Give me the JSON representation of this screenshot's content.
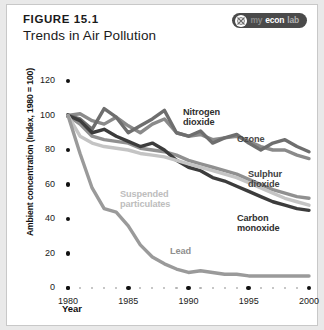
{
  "header": {
    "figure_number": "FIGURE 15.1",
    "title": "Trends in Air Pollution",
    "logo": {
      "icon": "myeconlab-circle-icon",
      "part1": "my",
      "part2": "econ",
      "part3": "lab"
    }
  },
  "colors": {
    "nitrogen_dioxide": "#8a8a8a",
    "ozone": "#6e6e6e",
    "sulphur_dioxide": "#909090",
    "carbon_monoxide": "#3c3c3c",
    "suspended_particulates": "#c4c4c4",
    "lead": "#9a9a9a",
    "axis": "#111111",
    "card_background": "#ffffff",
    "page_background": "#e9e9e9"
  },
  "chart_data": {
    "type": "line",
    "title": "Trends in Air Pollution",
    "xlabel": "Year",
    "ylabel": "Ambient concentration (Index, 1980 = 100)",
    "xlim": [
      1980,
      2000
    ],
    "ylim": [
      0,
      120
    ],
    "xticks": [
      1980,
      1985,
      1990,
      1995,
      2000
    ],
    "yticks": [
      0,
      20,
      40,
      60,
      80,
      100,
      120
    ],
    "grid": false,
    "legend": "inline-labels",
    "x": [
      1980,
      1981,
      1982,
      1983,
      1984,
      1985,
      1986,
      1987,
      1988,
      1989,
      1990,
      1991,
      1992,
      1993,
      1994,
      1995,
      1996,
      1997,
      1998,
      1999,
      2000
    ],
    "series": [
      {
        "name": "Nitrogen dioxide",
        "label": "Nitrogen\ndioxide",
        "color": "#8a8a8a",
        "values": [
          100,
          101,
          97,
          95,
          99,
          94,
          90,
          95,
          98,
          90,
          88,
          89,
          86,
          87,
          88,
          85,
          82,
          80,
          80,
          77,
          75
        ]
      },
      {
        "name": "Ozone",
        "label": "Ozone",
        "color": "#6e6e6e",
        "values": [
          100,
          98,
          92,
          104,
          99,
          90,
          94,
          98,
          103,
          90,
          88,
          91,
          84,
          87,
          89,
          84,
          80,
          84,
          86,
          82,
          79
        ]
      },
      {
        "name": "Sulphur dioxide",
        "label": "Sulphur\ndioxide",
        "color": "#909090",
        "values": [
          100,
          95,
          88,
          86,
          85,
          84,
          81,
          80,
          79,
          77,
          74,
          72,
          70,
          68,
          66,
          63,
          60,
          57,
          55,
          53,
          52
        ]
      },
      {
        "name": "Carbon monoxide",
        "label": "Carbon\nmonoxide",
        "color": "#3c3c3c",
        "values": [
          100,
          97,
          90,
          92,
          88,
          85,
          82,
          84,
          80,
          74,
          70,
          68,
          64,
          62,
          59,
          56,
          53,
          50,
          48,
          46,
          45
        ]
      },
      {
        "name": "Suspended particulates",
        "label": "Suspended\nparticulates",
        "color": "#c4c4c4",
        "values": [
          100,
          88,
          84,
          82,
          81,
          80,
          78,
          77,
          76,
          74,
          72,
          70,
          68,
          66,
          64,
          61,
          58,
          55,
          52,
          50,
          48
        ]
      },
      {
        "name": "Lead",
        "label": "Lead",
        "color": "#9a9a9a",
        "values": [
          100,
          78,
          58,
          46,
          44,
          36,
          25,
          18,
          14,
          11,
          9,
          10,
          9,
          8,
          8,
          7,
          7,
          7,
          7,
          7,
          7
        ]
      }
    ]
  }
}
